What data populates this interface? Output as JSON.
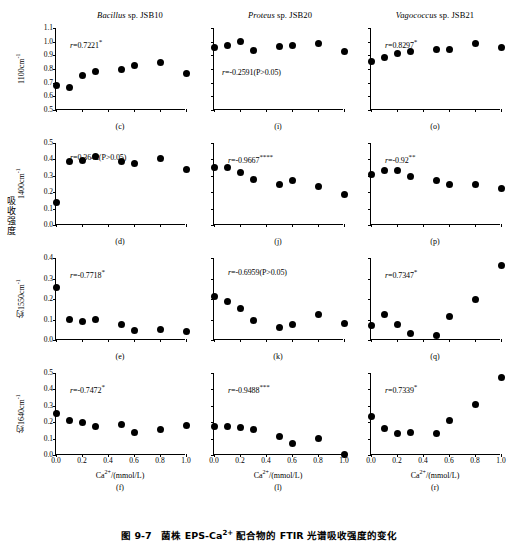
{
  "figure": {
    "caption_prefix": "图 9-7",
    "caption_text": "菌株 EPS-Ca2+ 配合物的 FTIR 光谱吸收强度的变化",
    "caption_full": "图 9-7   菌株 EPS-Ca2+ 配合物的 FTIR 光谱吸收强度的变化",
    "shared_ylabel": "吸收强度",
    "xaxis_title": "Ca2+/(mmol/L)",
    "column_titles": [
      {
        "genus": "Bacillus",
        "rest": " sp. JSB10"
      },
      {
        "genus": "Proteus",
        "rest": " sp. JSB20"
      },
      {
        "genus": "Vagococcus",
        "rest": " sp. JSB21"
      }
    ],
    "row_ylabels": [
      "1100cm-1",
      "1400cm-1",
      "约1550cm-1",
      "约1640cm-1"
    ],
    "xticks": [
      "0.0",
      "0.2",
      "0.4",
      "0.6",
      "0.8",
      "1.0"
    ],
    "marker_color": "#000000",
    "axis_color": "#000000"
  },
  "chart_data": [
    {
      "type": "scatter",
      "panel": "(c)",
      "title": "Bacillus sp. JSB10",
      "xlabel": "Ca2+/(mmol/L)",
      "ylabel": "1100cm-1",
      "annotation": "r=0.7221*",
      "r_value": 0.7221,
      "significance": "*",
      "xlim": [
        0.0,
        1.0
      ],
      "ylim": [
        0.5,
        1.1
      ],
      "yticks": [
        "0.5",
        "0.6",
        "0.7",
        "0.8",
        "0.9",
        "1.0",
        "1.1"
      ],
      "x": [
        0.0,
        0.1,
        0.2,
        0.3,
        0.5,
        0.6,
        0.8,
        1.0
      ],
      "values": [
        0.68,
        0.665,
        0.75,
        0.785,
        0.8,
        0.825,
        0.845,
        0.765
      ]
    },
    {
      "type": "scatter",
      "panel": "(i)",
      "title": "Proteus sp. JSB20",
      "xlabel": "Ca2+/(mmol/L)",
      "ylabel": "1100cm-1",
      "annotation": "r=-0.2591(P>0.05)",
      "r_value": -0.2591,
      "significance": "P>0.05",
      "xlim": [
        0.0,
        1.0
      ],
      "ylim": [
        0.5,
        1.1
      ],
      "yticks": [],
      "x": [
        0.0,
        0.1,
        0.2,
        0.3,
        0.5,
        0.6,
        0.8,
        1.0
      ],
      "values": [
        0.955,
        0.975,
        1.0,
        0.935,
        0.965,
        0.975,
        0.985,
        0.925
      ]
    },
    {
      "type": "scatter",
      "panel": "(o)",
      "title": "Vagococcus sp. JSB21",
      "xlabel": "Ca2+/(mmol/L)",
      "ylabel": "1100cm-1",
      "annotation": "r=0.8297*",
      "r_value": 0.8297,
      "significance": "*",
      "xlim": [
        0.0,
        1.0
      ],
      "ylim": [
        0.5,
        1.1
      ],
      "yticks": [],
      "x": [
        0.0,
        0.1,
        0.2,
        0.3,
        0.5,
        0.6,
        0.8,
        1.0
      ],
      "values": [
        0.855,
        0.885,
        0.915,
        0.925,
        0.945,
        0.945,
        0.985,
        0.955
      ]
    },
    {
      "type": "scatter",
      "panel": "(d)",
      "title": "Bacillus sp. JSB10",
      "xlabel": "Ca2+/(mmol/L)",
      "ylabel": "1400cm-1",
      "annotation": "r=0.3642(P>0.05)",
      "r_value": 0.3642,
      "significance": "P>0.05",
      "xlim": [
        0.0,
        1.0
      ],
      "ylim": [
        0.0,
        0.5
      ],
      "yticks": [
        "0.0",
        "0.1",
        "0.2",
        "0.3",
        "0.4",
        "0.5"
      ],
      "x": [
        0.0,
        0.1,
        0.2,
        0.3,
        0.5,
        0.6,
        0.8,
        1.0
      ],
      "values": [
        0.135,
        0.39,
        0.395,
        0.42,
        0.385,
        0.375,
        0.405,
        0.34
      ]
    },
    {
      "type": "scatter",
      "panel": "(j)",
      "title": "Proteus sp. JSB20",
      "xlabel": "Ca2+/(mmol/L)",
      "ylabel": "1400cm-1",
      "annotation": "r=-0.9667****",
      "r_value": -0.9667,
      "significance": "****",
      "xlim": [
        0.0,
        1.0
      ],
      "ylim": [
        0.0,
        0.5
      ],
      "yticks": [],
      "x": [
        0.0,
        0.1,
        0.2,
        0.3,
        0.5,
        0.6,
        0.8,
        1.0
      ],
      "values": [
        0.35,
        0.35,
        0.32,
        0.28,
        0.25,
        0.27,
        0.235,
        0.185
      ]
    },
    {
      "type": "scatter",
      "panel": "(p)",
      "title": "Vagococcus sp. JSB21",
      "xlabel": "Ca2+/(mmol/L)",
      "ylabel": "1400cm-1",
      "annotation": "r=-0.92**",
      "r_value": -0.92,
      "significance": "**",
      "xlim": [
        0.0,
        1.0
      ],
      "ylim": [
        0.0,
        0.5
      ],
      "yticks": [],
      "x": [
        0.0,
        0.1,
        0.2,
        0.3,
        0.5,
        0.6,
        0.8,
        1.0
      ],
      "values": [
        0.31,
        0.33,
        0.33,
        0.295,
        0.27,
        0.245,
        0.25,
        0.22
      ]
    },
    {
      "type": "scatter",
      "panel": "(e)",
      "title": "Bacillus sp. JSB10",
      "xlabel": "Ca2+/(mmol/L)",
      "ylabel": "约1550cm-1",
      "annotation": "r=-0.7718*",
      "r_value": -0.7718,
      "significance": "*",
      "xlim": [
        0.0,
        1.0
      ],
      "ylim": [
        0.0,
        0.4
      ],
      "yticks": [
        "0.0",
        "0.1",
        "0.2",
        "0.3",
        "0.4"
      ],
      "x": [
        0.0,
        0.1,
        0.2,
        0.3,
        0.5,
        0.6,
        0.8,
        1.0
      ],
      "values": [
        0.255,
        0.1,
        0.09,
        0.1,
        0.075,
        0.045,
        0.05,
        0.04
      ]
    },
    {
      "type": "scatter",
      "panel": "(k)",
      "title": "Proteus sp. JSB20",
      "xlabel": "Ca2+/(mmol/L)",
      "ylabel": "约1550cm-1",
      "annotation": "r=-0.6959(P>0.05)",
      "r_value": -0.6959,
      "significance": "P>0.05",
      "xlim": [
        0.0,
        1.0
      ],
      "ylim": [
        0.0,
        0.4
      ],
      "yticks": [],
      "x": [
        0.0,
        0.1,
        0.2,
        0.3,
        0.5,
        0.6,
        0.8,
        1.0
      ],
      "values": [
        0.21,
        0.19,
        0.155,
        0.095,
        0.06,
        0.075,
        0.125,
        0.08
      ]
    },
    {
      "type": "scatter",
      "panel": "(q)",
      "title": "Vagococcus sp. JSB21",
      "xlabel": "Ca2+/(mmol/L)",
      "ylabel": "约1550cm-1",
      "annotation": "r=0.7347*",
      "r_value": 0.7347,
      "significance": "*",
      "xlim": [
        0.0,
        1.0
      ],
      "ylim": [
        0.0,
        0.4
      ],
      "yticks": [],
      "x": [
        0.0,
        0.1,
        0.2,
        0.3,
        0.5,
        0.6,
        0.8,
        1.0
      ],
      "values": [
        0.07,
        0.125,
        0.075,
        0.03,
        0.02,
        0.115,
        0.2,
        0.365
      ]
    },
    {
      "type": "scatter",
      "panel": "(f)",
      "title": "Bacillus sp. JSB10",
      "xlabel": "Ca2+/(mmol/L)",
      "ylabel": "约1640cm-1",
      "annotation": "r=-0.7472*",
      "r_value": -0.7472,
      "significance": "*",
      "xlim": [
        0.0,
        1.0
      ],
      "ylim": [
        0.0,
        0.5
      ],
      "yticks": [
        "0.0",
        "0.1",
        "0.2",
        "0.3",
        "0.4",
        "0.5"
      ],
      "x": [
        0.0,
        0.1,
        0.2,
        0.3,
        0.5,
        0.6,
        0.8,
        1.0
      ],
      "values": [
        0.255,
        0.21,
        0.2,
        0.175,
        0.185,
        0.135,
        0.155,
        0.18
      ]
    },
    {
      "type": "scatter",
      "panel": "(l)",
      "title": "Proteus sp. JSB20",
      "xlabel": "Ca2+/(mmol/L)",
      "ylabel": "约1640cm-1",
      "annotation": "r=-0.9488***",
      "r_value": -0.9488,
      "significance": "***",
      "xlim": [
        0.0,
        1.0
      ],
      "ylim": [
        0.0,
        0.5
      ],
      "yticks": [],
      "x": [
        0.0,
        0.1,
        0.2,
        0.3,
        0.5,
        0.6,
        0.8,
        1.0
      ],
      "values": [
        0.175,
        0.175,
        0.17,
        0.155,
        0.11,
        0.07,
        0.1,
        0.005
      ]
    },
    {
      "type": "scatter",
      "panel": "(r)",
      "title": "Vagococcus sp. JSB21",
      "xlabel": "Ca2+/(mmol/L)",
      "ylabel": "约1640cm-1",
      "annotation": "r=0.7339*",
      "r_value": 0.7339,
      "significance": "*",
      "xlim": [
        0.0,
        1.0
      ],
      "ylim": [
        0.0,
        0.5
      ],
      "yticks": [],
      "x": [
        0.0,
        0.1,
        0.2,
        0.3,
        0.5,
        0.6,
        0.8,
        1.0
      ],
      "values": [
        0.235,
        0.16,
        0.13,
        0.135,
        0.13,
        0.21,
        0.31,
        0.47
      ]
    }
  ]
}
